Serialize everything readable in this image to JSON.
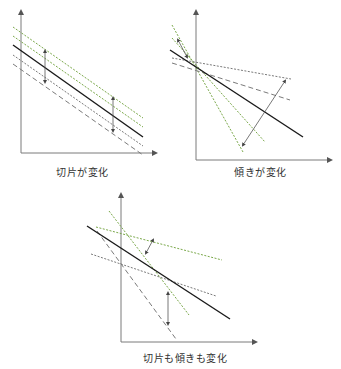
{
  "colors": {
    "axis": "#7a7a7a",
    "solid_line": "#1a1a1a",
    "green_dashed": "#7aa84a",
    "grey_dashed": "#7a7a7a",
    "arrow": "#555555"
  },
  "panels": [
    {
      "id": "intercept",
      "caption": "切片が変化",
      "axes": {
        "origin": [
          21,
          153
        ],
        "y_top": 12,
        "x_right": 155
      },
      "solid": [
        [
          13,
          45
        ],
        [
          143,
          137
        ]
      ],
      "green_dashed": [
        [
          [
            13,
            27
          ],
          [
            143,
            118
          ]
        ],
        [
          [
            13,
            36
          ],
          [
            143,
            127
          ]
        ]
      ],
      "grey_dashed": [
        [
          [
            13,
            55
          ],
          [
            143,
            146
          ]
        ],
        [
          [
            13,
            64
          ],
          [
            143,
            155
          ]
        ]
      ],
      "arrows": [
        [
          [
            45,
            51
          ],
          [
            45,
            82
          ]
        ],
        [
          [
            113,
            98
          ],
          [
            113,
            131
          ]
        ]
      ]
    },
    {
      "id": "slope",
      "caption": "傾きが変化",
      "axes": {
        "origin": [
          196,
          160
        ],
        "y_top": 12,
        "x_right": 330
      },
      "solid": [
        [
          170,
          50
        ],
        [
          303,
          137
        ]
      ],
      "green_dashed": [
        [
          [
            172,
            25
          ],
          [
            243,
            152
          ]
        ],
        [
          [
            172,
            38
          ],
          [
            265,
            142
          ]
        ]
      ],
      "grey_dashed": [
        [
          [
            172,
            58
          ],
          [
            291,
            79
          ]
        ],
        [
          [
            172,
            63
          ],
          [
            290,
            100
          ]
        ]
      ],
      "arrows": [
        [
          [
            178,
            40
          ],
          [
            187,
            57
          ]
        ],
        [
          [
            243,
            145
          ],
          [
            285,
            81
          ]
        ]
      ]
    },
    {
      "id": "both",
      "caption": "切片も傾きも変化",
      "axes": {
        "origin": [
          121,
          342
        ],
        "y_top": 195,
        "x_right": 255
      },
      "solid": [
        [
          87,
          226
        ],
        [
          230,
          319
        ]
      ],
      "green_dashed": [
        [
          [
            96,
            227
          ],
          [
            222,
            260
          ]
        ],
        [
          [
            109,
            211
          ],
          [
            189,
            315
          ]
        ]
      ],
      "grey_dashed": [
        [
          [
            91,
            254
          ],
          [
            216,
            296
          ]
        ],
        [
          [
            97,
            231
          ],
          [
            176,
            339
          ]
        ]
      ],
      "arrows": [
        [
          [
            146,
            253
          ],
          [
            153,
            240
          ]
        ],
        [
          [
            168,
            293
          ],
          [
            168,
            324
          ]
        ]
      ]
    }
  ],
  "captions": {
    "intercept": "切片が変化",
    "slope": "傾きが変化",
    "both": "切片も傾きも変化"
  }
}
